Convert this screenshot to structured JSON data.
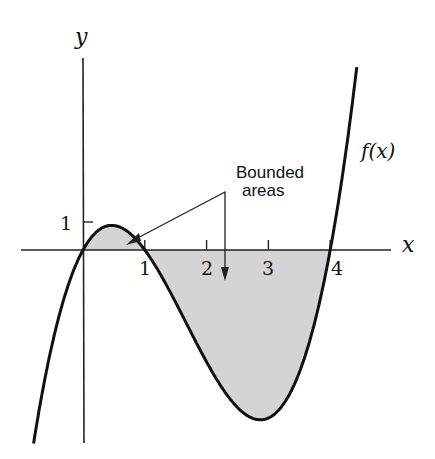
{
  "chart_data": {
    "type": "line",
    "title": "",
    "function_label": "f(x)",
    "xlabel": "x",
    "ylabel": "y",
    "x_ticks": [
      1,
      2,
      3,
      4
    ],
    "x_tick_labels": [
      "1",
      "2",
      "3",
      "4"
    ],
    "y_ticks": [
      1
    ],
    "y_tick_labels": [
      "1"
    ],
    "xlim": [
      -1.0,
      5.0
    ],
    "ylim": [
      -6.9,
      6.9
    ],
    "grid": false,
    "legend": null,
    "series": [
      {
        "name": "f(x)",
        "formula": "x^3 - 5x^2 + 4x",
        "x": [
          -0.8,
          -0.5,
          0,
          0.25,
          0.5,
          0.75,
          1,
          1.5,
          2,
          2.5,
          2.87,
          3,
          3.5,
          4,
          4.25,
          4.43
        ],
        "y": [
          -6.27,
          -3.375,
          0,
          0.766,
          0.875,
          0.609,
          0,
          -1.875,
          -4,
          -5.625,
          -6.06,
          -6,
          -4.375,
          0,
          2.39,
          6.5
        ]
      }
    ],
    "shaded_regions": [
      {
        "from": 0,
        "to": 1,
        "description": "bounded area above x-axis"
      },
      {
        "from": 1,
        "to": 4,
        "description": "bounded area below x-axis"
      }
    ],
    "annotations": [
      {
        "text_line1": "Bounded",
        "text_line2": "areas",
        "arrows_to": [
          "region 0-1",
          "region 1-4"
        ]
      }
    ]
  },
  "colors": {
    "curve": "#111111",
    "axis": "#222222",
    "fill": "#d4d4d4"
  }
}
